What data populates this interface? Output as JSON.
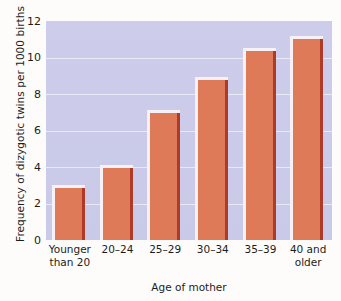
{
  "chart_data": {
    "type": "bar",
    "title": "",
    "xlabel": "Age of mother",
    "ylabel": "Frequency of dizygotic twins per 1000 births",
    "categories": [
      "Younger\nthan 20",
      "20–24",
      "25–29",
      "30–34",
      "35–39",
      "40 and\nolder"
    ],
    "category_lines": [
      [
        "Younger",
        "than 20"
      ],
      [
        "20–24"
      ],
      [
        "25–29"
      ],
      [
        "30–34"
      ],
      [
        "35–39"
      ],
      [
        "40 and",
        "older"
      ]
    ],
    "values": [
      2.9,
      4.0,
      7.0,
      8.8,
      10.4,
      11.05
    ],
    "ylim": [
      0,
      12
    ],
    "yticks": [
      0,
      2,
      4,
      6,
      8,
      10,
      12
    ],
    "ytick_labels": [
      "0",
      "2",
      "4",
      "6",
      "8",
      "10",
      "12"
    ],
    "grid": true,
    "grid_axis": "y",
    "legend": false,
    "legend_position": "none",
    "colors": {
      "bar_fill": "#de7a58",
      "bar_shadow": "#b03a28",
      "bar_highlight": "#f6f1f6",
      "plot_background": "#ccccea",
      "gridline": "#eeeef8",
      "page_background": "#fdfcfa",
      "text": "#1c1c1c"
    }
  }
}
